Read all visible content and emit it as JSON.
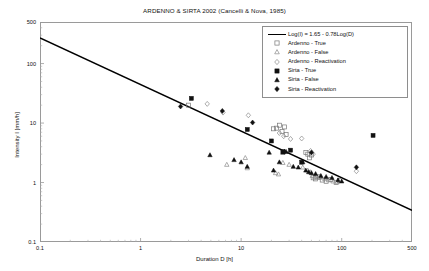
{
  "chart_data": {
    "type": "scatter",
    "title": "ARDENNO & SIRTA 2002 (Cancelli & Nova, 1985)",
    "xlabel": "Duration D [h]",
    "ylabel": "Intensity I [mm/h]",
    "xscale": "log",
    "yscale": "log",
    "xlim": [
      0.1,
      500
    ],
    "ylim": [
      0.1,
      500
    ],
    "grid": false,
    "legend_position": "top-right",
    "xticks": [
      "0.1",
      "1",
      "10",
      "100",
      "500"
    ],
    "xtick_values": [
      0.1,
      1,
      10,
      100,
      500
    ],
    "yticks": [
      "0.1",
      "1",
      "10",
      "100",
      "500"
    ],
    "ytick_values": [
      0.1,
      1,
      10,
      100,
      500
    ],
    "trendline": {
      "label": "Log(I) = 1.65 - 0.78Log(D)",
      "intercept": 1.65,
      "slope": -0.78,
      "color": "#000000",
      "x_start": 0.1,
      "x_end": 500,
      "y_start": 270.0,
      "y_end": 0.34
    },
    "series": [
      {
        "name": "Ardenno - True",
        "marker": "open-square",
        "color": "#777777",
        "points": [
          [
            3.0,
            20.0
          ],
          [
            21.0,
            8.0
          ],
          [
            22.5,
            8.2
          ],
          [
            24.0,
            9.2
          ],
          [
            25.5,
            7.2
          ],
          [
            27.0,
            8.6
          ],
          [
            28.0,
            6.4
          ],
          [
            44.0,
            3.2
          ],
          [
            46.0,
            3.0
          ],
          [
            48.0,
            2.6
          ],
          [
            50.0,
            2.9
          ],
          [
            52.0,
            1.2
          ],
          [
            55.0,
            1.15
          ],
          [
            60.0,
            1.25
          ],
          [
            64.0,
            1.1
          ],
          [
            70.0,
            1.05
          ],
          [
            78.0,
            1.12
          ],
          [
            88.0,
            1.0
          ],
          [
            95.0,
            1.08
          ]
        ]
      },
      {
        "name": "Ardenno - False",
        "marker": "open-triangle",
        "color": "#8a8a8a",
        "points": [
          [
            7.2,
            2.0
          ],
          [
            11.5,
            1.75
          ],
          [
            11.0,
            2.6
          ],
          [
            22.0,
            1.45
          ],
          [
            23.5,
            1.38
          ],
          [
            26.0,
            2.15
          ],
          [
            30.0,
            2.0
          ],
          [
            41.0,
            1.8
          ],
          [
            46.0,
            1.6
          ],
          [
            49.0,
            1.5
          ],
          [
            51.0,
            1.3
          ],
          [
            54.0,
            1.25
          ],
          [
            58.0,
            1.2
          ],
          [
            62.0,
            1.22
          ],
          [
            68.0,
            1.15
          ],
          [
            74.0,
            1.1
          ],
          [
            82.0,
            1.05
          ],
          [
            90.0,
            1.02
          ]
        ]
      },
      {
        "name": "Ardenno - Reactivation",
        "marker": "open-diamond",
        "color": "#8a8a8a",
        "points": [
          [
            4.6,
            21.0
          ],
          [
            6.6,
            15.0
          ],
          [
            11.8,
            13.5
          ],
          [
            24.0,
            6.8
          ],
          [
            26.5,
            6.0
          ],
          [
            31.0,
            5.4
          ],
          [
            40.0,
            5.5
          ],
          [
            49.0,
            3.4
          ],
          [
            52.0,
            3.0
          ],
          [
            140.0,
            1.55
          ]
        ]
      },
      {
        "name": "Sirta - True",
        "marker": "filled-square",
        "color": "#111111",
        "points": [
          [
            3.2,
            26.0
          ],
          [
            11.5,
            7.8
          ],
          [
            20.0,
            5.0
          ],
          [
            26.0,
            3.3
          ],
          [
            31.0,
            3.5
          ],
          [
            40.0,
            2.2
          ],
          [
            205.0,
            6.2
          ]
        ]
      },
      {
        "name": "Sirta - False",
        "marker": "filled-triangle",
        "color": "#111111",
        "points": [
          [
            4.9,
            2.9
          ],
          [
            8.5,
            2.4
          ],
          [
            10.0,
            2.2
          ],
          [
            11.5,
            1.85
          ],
          [
            19.0,
            3.2
          ],
          [
            21.0,
            1.6
          ],
          [
            24.0,
            2.2
          ],
          [
            26.0,
            3.2
          ],
          [
            28.0,
            3.3
          ],
          [
            33.0,
            1.85
          ],
          [
            37.0,
            1.8
          ],
          [
            41.0,
            2.2
          ],
          [
            44.0,
            1.6
          ],
          [
            47.0,
            1.5
          ],
          [
            50.0,
            1.45
          ],
          [
            55.0,
            1.4
          ],
          [
            62.0,
            1.3
          ],
          [
            70.0,
            1.25
          ],
          [
            80.0,
            1.2
          ],
          [
            92.0,
            1.1
          ],
          [
            100.0,
            1.05
          ]
        ]
      },
      {
        "name": "Sirta - Reactivation",
        "marker": "filled-diamond",
        "color": "#111111",
        "points": [
          [
            2.5,
            19.0
          ],
          [
            6.5,
            16.0
          ],
          [
            13.0,
            10.2
          ],
          [
            27.0,
            3.3
          ],
          [
            50.0,
            3.2
          ],
          [
            140.0,
            1.8
          ]
        ]
      }
    ]
  }
}
